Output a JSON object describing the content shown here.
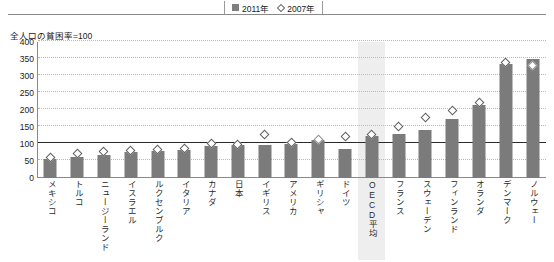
{
  "legend": {
    "entries": [
      {
        "label": "2011年",
        "marker": "filled-square",
        "color": "#7f7f7f"
      },
      {
        "label": "2007年",
        "marker": "open-diamond",
        "color": "#6e6e6e"
      }
    ]
  },
  "axis_title": "全人口の貧困率=100",
  "chart_data": {
    "type": "bar",
    "title": "全人口の貧困率=100",
    "xlabel": "",
    "ylabel": "全人口の貧困率=100",
    "ylim": [
      0,
      400
    ],
    "yticks": [
      0,
      50,
      100,
      150,
      200,
      250,
      300,
      350,
      400
    ],
    "grid": true,
    "reference_line": 100,
    "legend_position": "top-center",
    "highlight_category": "OECD平均",
    "categories": [
      "メキシコ",
      "トルコ",
      "ニュージーランド",
      "イスラエル",
      "ルクセンブルク",
      "イタリア",
      "カナダ",
      "日本",
      "イギリス",
      "アメリカ",
      "ギリシャ",
      "ドイツ",
      "OECD平均",
      "フランス",
      "スウェーデン",
      "フィンランド",
      "オランダ",
      "デンマーク",
      "ノルウェー"
    ],
    "series": [
      {
        "name": "2011年",
        "marker": "bar",
        "values": [
          55,
          62,
          68,
          76,
          78,
          82,
          95,
          96,
          98,
          100,
          112,
          85,
          125,
          128,
          140,
          175,
          215,
          335,
          350
        ]
      },
      {
        "name": "2007年",
        "marker": "diamond",
        "values": [
          60,
          72,
          78,
          80,
          84,
          88,
          102,
          100,
          128,
          104,
          112,
          122,
          128,
          152,
          178,
          200,
          222,
          340,
          330
        ]
      }
    ]
  },
  "colors": {
    "bar": "#7b7b7b",
    "marker_fill": "#ffffff",
    "marker_stroke": "#5f5f5f",
    "grid": "#b9b9b9",
    "axis": "#8a8a8a",
    "reference": "#2a2a2a",
    "highlight": "#eeeeee"
  }
}
